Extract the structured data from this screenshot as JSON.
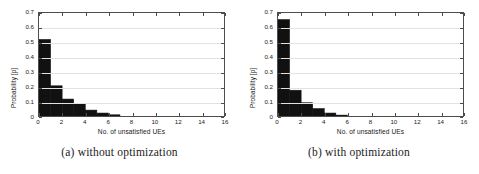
{
  "figure": {
    "panels": [
      {
        "id": "panel-a",
        "caption": "(a) without optimization",
        "chart_data": {
          "type": "bar",
          "title": "",
          "subtitle": "",
          "xlabel": "No. of unsatisfied UEs",
          "ylabel": "Probability [p]",
          "xlim": [
            0,
            16
          ],
          "ylim": [
            0,
            0.7
          ],
          "xticks": [
            0,
            2,
            4,
            6,
            8,
            10,
            12,
            14,
            16
          ],
          "xtick_labels": [
            "0",
            "2",
            "4",
            "6",
            "8",
            "10",
            "12",
            "14",
            "16"
          ],
          "yticks": [
            0,
            0.1,
            0.2,
            0.3,
            0.4,
            0.5,
            0.6,
            0.7
          ],
          "ytick_labels": [
            "0",
            "0.1",
            "0.2",
            "0.3",
            "0.4",
            "0.5",
            "0.6",
            "0.7"
          ],
          "grid": "horizontal",
          "legend": "none",
          "bar_color": "#111111",
          "bin_width": 1,
          "categories": [
            0,
            1,
            2,
            3,
            4,
            5,
            6,
            7,
            8,
            9,
            10,
            11,
            12,
            13,
            14,
            15
          ],
          "values": [
            0.52,
            0.205,
            0.115,
            0.085,
            0.04,
            0.02,
            0.008,
            0.0,
            0.0,
            0.0,
            0.0,
            0.0,
            0.0,
            0.0,
            0.0,
            0.0
          ]
        }
      },
      {
        "id": "panel-b",
        "caption": "(b) with optimization",
        "chart_data": {
          "type": "bar",
          "title": "",
          "subtitle": "",
          "xlabel": "No. of unsatisfied UEs",
          "ylabel": "Probability [p]",
          "xlim": [
            0,
            16
          ],
          "ylim": [
            0,
            0.7
          ],
          "xticks": [
            0,
            2,
            4,
            6,
            8,
            10,
            12,
            14,
            16
          ],
          "xtick_labels": [
            "0",
            "2",
            "4",
            "6",
            "8",
            "10",
            "12",
            "14",
            "16"
          ],
          "yticks": [
            0,
            0.1,
            0.2,
            0.3,
            0.4,
            0.5,
            0.6,
            0.7
          ],
          "ytick_labels": [
            "0",
            "0.1",
            "0.2",
            "0.3",
            "0.4",
            "0.5",
            "0.6",
            "0.7"
          ],
          "grid": "horizontal",
          "legend": "none",
          "bar_color": "#111111",
          "bin_width": 1,
          "categories": [
            0,
            1,
            2,
            3,
            4,
            5,
            6,
            7,
            8,
            9,
            10,
            11,
            12,
            13,
            14,
            15
          ],
          "values": [
            0.655,
            0.175,
            0.09,
            0.05,
            0.02,
            0.006,
            0.0,
            0.0,
            0.0,
            0.0,
            0.0,
            0.0,
            0.0,
            0.0,
            0.0,
            0.0
          ]
        }
      }
    ],
    "colors": {
      "bar": "#111111",
      "axis": "#4d4d4d",
      "grid": "#e2e2e2",
      "text": "#1a1a1a",
      "background": "#ffffff"
    }
  }
}
